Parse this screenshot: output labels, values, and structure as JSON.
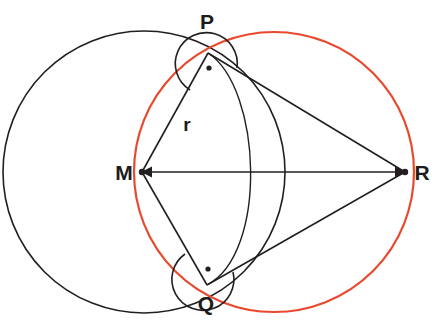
{
  "diagram": {
    "canvas": {
      "width": 443,
      "height": 323,
      "background": "#ffffff"
    },
    "colors": {
      "stroke_black": "#231f20",
      "stroke_red": "#e8492f",
      "label_text": "#1c1c1c"
    },
    "points": [
      {
        "id": "P",
        "label": "P",
        "x": 208,
        "y": 53,
        "label_x": 207,
        "label_y": 29,
        "dot": false
      },
      {
        "id": "M",
        "label": "M",
        "x": 142,
        "y": 172,
        "label_x": 124,
        "label_y": 180,
        "dot": true
      },
      {
        "id": "R",
        "label": "R",
        "x": 405,
        "y": 172,
        "label_x": 422,
        "label_y": 180,
        "dot": true
      },
      {
        "id": "Q",
        "label": "Q",
        "x": 207,
        "y": 285,
        "label_x": 206,
        "label_y": 311,
        "dot": false
      }
    ],
    "circles": [
      {
        "id": "circle-m",
        "name": "black-circle-center-m",
        "cx": 144,
        "cy": 172,
        "r": 141,
        "stroke": "#231f20",
        "stroke_width": 1.6
      },
      {
        "id": "circle-thales",
        "name": "red-thales-circle-over-mr",
        "cx": 274,
        "cy": 172,
        "r": 140,
        "stroke": "#e8492f",
        "stroke_width": 2.2
      }
    ],
    "segments": [
      {
        "id": "MR",
        "name": "segment-m-r",
        "x1": 142,
        "y1": 172,
        "x2": 405,
        "y2": 172,
        "arrow_start": true,
        "arrow_end": true
      },
      {
        "id": "MP",
        "name": "segment-m-p-radius",
        "x1": 142,
        "y1": 172,
        "x2": 208,
        "y2": 53,
        "arrow_start": false,
        "arrow_end": false
      },
      {
        "id": "MQ",
        "name": "segment-m-q-radius",
        "x1": 142,
        "y1": 172,
        "x2": 207,
        "y2": 285,
        "arrow_start": false,
        "arrow_end": false
      },
      {
        "id": "PR",
        "name": "segment-p-r-tangent",
        "x1": 208,
        "y1": 53,
        "x2": 405,
        "y2": 172,
        "arrow_start": false,
        "arrow_end": false
      },
      {
        "id": "QR",
        "name": "segment-q-r-tangent",
        "x1": 207,
        "y1": 285,
        "x2": 405,
        "y2": 172,
        "arrow_start": false,
        "arrow_end": false
      }
    ],
    "arcs": [
      {
        "id": "arc-pq",
        "name": "arc-p-q-centered-at-r",
        "path": "M 208 53 C 262 88 268 254 207 285",
        "stroke": "#231f20",
        "stroke_width": 1.4,
        "crosses_mr_at_x": 272
      }
    ],
    "angle_markers": [
      {
        "id": "right-angle-P",
        "name": "right-angle-marker-at-p",
        "vertex": "P",
        "vertex_x": 208,
        "vertex_y": 53,
        "arc_path": "M 190 90 A 31 31 0 1 1 237 68",
        "dot_x": 209,
        "dot_y": 68,
        "dot_r": 2.6,
        "meaning": "90 degrees"
      },
      {
        "id": "right-angle-Q",
        "name": "right-angle-marker-at-q",
        "vertex": "Q",
        "vertex_x": 207,
        "vertex_y": 285,
        "arc_path": "M 185 254 A 31 31 0 1 0 233 272",
        "dot_x": 208,
        "dot_y": 269,
        "dot_r": 2.6,
        "meaning": "90 degrees"
      }
    ],
    "length_labels": [
      {
        "id": "r",
        "name": "radius-label-r",
        "text": "r",
        "x": 187,
        "y": 131
      }
    ]
  }
}
